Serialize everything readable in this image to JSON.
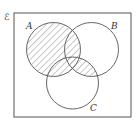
{
  "diagram": {
    "type": "venn",
    "universal_symbol": "ℰ",
    "sets": [
      {
        "label": "A",
        "cx": 53.5,
        "cy": 49.5,
        "r": 27
      },
      {
        "label": "B",
        "cx": 91.5,
        "cy": 49.5,
        "r": 27
      },
      {
        "label": "C",
        "cx": 72.5,
        "cy": 83,
        "r": 26
      }
    ],
    "shaded_region": "A ∪ (B ∩ C)",
    "colors": {
      "stroke": "#555555",
      "hatch": "#777777",
      "background": "#ffffff"
    }
  }
}
